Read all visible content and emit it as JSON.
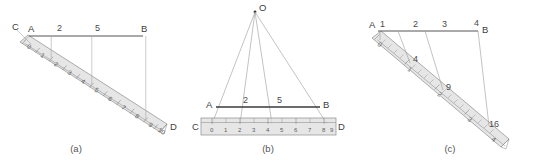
{
  "figure": {
    "background_color": "#ffffff",
    "ruler_fill": "#dddddd",
    "line_color": "#3a3a3a",
    "thin_line_color": "#9a9a9a"
  },
  "panels": [
    {
      "id": "a",
      "caption": "(a)",
      "top_labels": [
        "C",
        "A",
        "2",
        "5",
        "B"
      ],
      "ruler": {
        "orientation": "diagonal",
        "start_label": "C",
        "end_label": "D",
        "ticks": [
          "0",
          "1",
          "2",
          "3",
          "4",
          "5",
          "6",
          "7",
          "8",
          "9",
          "10"
        ]
      },
      "projection_values": [
        "0",
        "2",
        "5",
        "9"
      ]
    },
    {
      "id": "b",
      "caption": "(b)",
      "apex_label": "O",
      "segment_labels": [
        "A",
        "2",
        "5",
        "B"
      ],
      "ruler": {
        "orientation": "horizontal",
        "start_label": "C",
        "end_label": "D",
        "ticks": [
          "0",
          "1",
          "2",
          "3",
          "4",
          "5",
          "6",
          "7",
          "8",
          "9"
        ]
      },
      "ray_values": [
        "0",
        "2",
        "5",
        "9"
      ]
    },
    {
      "id": "c",
      "caption": "(c)",
      "top_labels": [
        "A",
        "1",
        "2",
        "3",
        "4",
        "B"
      ],
      "ruler": {
        "orientation": "diagonal",
        "ticks": [
          "0",
          "1",
          "2",
          "3",
          "4"
        ]
      },
      "intersection_labels": [
        "4",
        "9",
        "16"
      ]
    }
  ]
}
